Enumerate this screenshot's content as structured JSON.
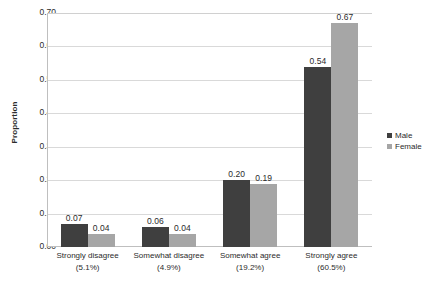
{
  "chart_data": {
    "type": "bar",
    "title": "",
    "xlabel": "",
    "ylabel": "Proportion",
    "ylim": [
      0.0,
      0.7
    ],
    "ytick_step": 0.1,
    "yticks": [
      "0.70",
      "0.60",
      "0.50",
      "0.40",
      "0.30",
      "0.20",
      "0.10",
      "0.00"
    ],
    "grid": true,
    "legend_position": "right",
    "categories": [
      "Strongly disagree",
      "Somewhat disagree",
      "Somewhat agree",
      "Strongly agree"
    ],
    "category_percents": [
      "(5.1%)",
      "(4.9%)",
      "(19.2%)",
      "(60.5%)"
    ],
    "series": [
      {
        "name": "Male",
        "color": "#3f3f3f",
        "values": [
          0.07,
          0.06,
          0.2,
          0.54
        ],
        "labels": [
          "0.07",
          "0.06",
          "0.20",
          "0.54"
        ]
      },
      {
        "name": "Female",
        "color": "#a6a6a6",
        "values": [
          0.04,
          0.04,
          0.19,
          0.67
        ],
        "labels": [
          "0.04",
          "0.04",
          "0.19",
          "0.67"
        ]
      }
    ]
  },
  "colors": {
    "male": "#3f3f3f",
    "female": "#a6a6a6",
    "gridline": "#d9d9d9",
    "axis": "#bfbfbf",
    "text": "#2b2b2b",
    "background": "#ffffff"
  }
}
